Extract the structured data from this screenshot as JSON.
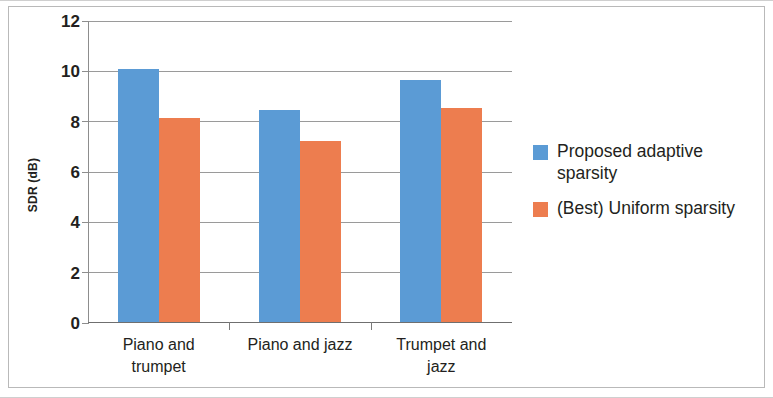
{
  "chart_data": {
    "type": "bar",
    "title": "",
    "xlabel": "",
    "ylabel": "SDR (dB)",
    "categories": [
      "Piano and trumpet",
      "Piano and jazz",
      "Trumpet and jazz"
    ],
    "series": [
      {
        "name": "Proposed adaptive sparsity",
        "color": "#5B9BD5",
        "values": [
          10.1,
          8.45,
          9.65
        ]
      },
      {
        "name": "(Best) Uniform sparsity",
        "color": "#ED7D4F",
        "values": [
          8.15,
          7.25,
          8.55
        ]
      }
    ],
    "ylim": [
      0,
      12
    ],
    "yticks": [
      0,
      2,
      4,
      6,
      8,
      10,
      12
    ],
    "ytick_labels": [
      "0",
      "2",
      "4",
      "6",
      "8",
      "10",
      "12"
    ],
    "grid": true,
    "grid_axis": "y",
    "legend_position": "right",
    "bar_gap_between_groups": true
  },
  "axis": {
    "y_title": "SDR (dB)",
    "ticks": [
      {
        "value": 12,
        "label": "12"
      },
      {
        "value": 10,
        "label": "10"
      },
      {
        "value": 8,
        "label": "8"
      },
      {
        "value": 6,
        "label": "6"
      },
      {
        "value": 4,
        "label": "4"
      },
      {
        "value": 2,
        "label": "2"
      },
      {
        "value": 0,
        "label": "0"
      }
    ]
  },
  "categories": [
    {
      "line1": "Piano and",
      "line2": "trumpet"
    },
    {
      "line1": "Piano and jazz",
      "line2": ""
    },
    {
      "line1": "Trumpet and",
      "line2": "jazz"
    }
  ],
  "legend": {
    "items": [
      {
        "label": "Proposed adaptive sparsity",
        "color": "#5B9BD5"
      },
      {
        "label": "(Best) Uniform sparsity",
        "color": "#ED7D4F"
      }
    ]
  }
}
